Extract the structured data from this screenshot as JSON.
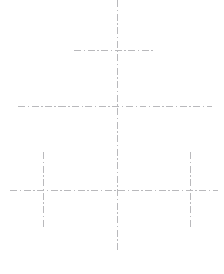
{
  "drawing": {
    "title": "Centerline Construction Layout",
    "background_color": "#ffffff",
    "width": 224,
    "height": 274,
    "line_color": "#b9b9bc",
    "line_width": 1,
    "line_style": "dash-dot",
    "dash_pattern": "7 2.5 1.5 2.5",
    "centerlines": [
      {
        "name": "main-vertical-centerline",
        "orientation": "vertical",
        "x1": 117.5,
        "y1": 0,
        "x2": 117.5,
        "y2": 252,
        "color": "#b9b9bc",
        "width": 1
      },
      {
        "name": "upper-horizontal-centerline",
        "orientation": "horizontal",
        "x1": 74,
        "y1": 50.5,
        "x2": 155,
        "y2": 50.5,
        "color": "#b9b9bc",
        "width": 1
      },
      {
        "name": "middle-horizontal-centerline",
        "orientation": "horizontal",
        "x1": 18,
        "y1": 106.5,
        "x2": 212,
        "y2": 106.5,
        "color": "#b9b9bc",
        "width": 1
      },
      {
        "name": "lower-horizontal-centerline",
        "orientation": "horizontal",
        "x1": 10,
        "y1": 190.5,
        "x2": 218,
        "y2": 190.5,
        "color": "#b9b9bc",
        "width": 1
      },
      {
        "name": "left-vertical-centerline",
        "orientation": "vertical",
        "x1": 43.5,
        "y1": 152,
        "x2": 43.5,
        "y2": 228,
        "color": "#b9b9bc",
        "width": 1
      },
      {
        "name": "right-vertical-centerline",
        "orientation": "vertical",
        "x1": 190.5,
        "y1": 152,
        "x2": 190.5,
        "y2": 228,
        "color": "#b9b9bc",
        "width": 1
      }
    ],
    "intersections": [
      {
        "name": "upper-cross",
        "x": 117.5,
        "y": 50.5
      },
      {
        "name": "center-cross",
        "x": 117.5,
        "y": 106.5
      },
      {
        "name": "lower-center-cross",
        "x": 117.5,
        "y": 190.5
      },
      {
        "name": "lower-left-cross",
        "x": 43.5,
        "y": 190.5
      },
      {
        "name": "lower-right-cross",
        "x": 190.5,
        "y": 190.5
      }
    ]
  }
}
